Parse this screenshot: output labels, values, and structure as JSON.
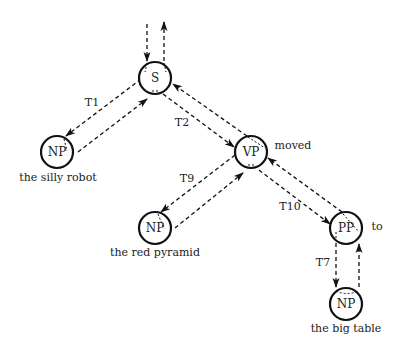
{
  "diagram": {
    "type": "parse-tree-traversal",
    "nodes": [
      {
        "id": "S",
        "label": "S",
        "word": ""
      },
      {
        "id": "NP1",
        "label": "NP",
        "word": "the silly robot"
      },
      {
        "id": "VP",
        "label": "VP",
        "word": "moved"
      },
      {
        "id": "NP2",
        "label": "NP",
        "word": "the red pyramid"
      },
      {
        "id": "PP",
        "label": "PP",
        "word": "to"
      },
      {
        "id": "NP3",
        "label": "NP",
        "word": "the big table"
      }
    ],
    "edges": [
      {
        "from": "S",
        "to": "NP1",
        "label": "T1"
      },
      {
        "from": "S",
        "to": "VP",
        "label": "T2"
      },
      {
        "from": "VP",
        "to": "NP2",
        "label": "T9"
      },
      {
        "from": "VP",
        "to": "PP",
        "label": "T10"
      },
      {
        "from": "PP",
        "to": "NP3",
        "label": "T7"
      }
    ]
  }
}
